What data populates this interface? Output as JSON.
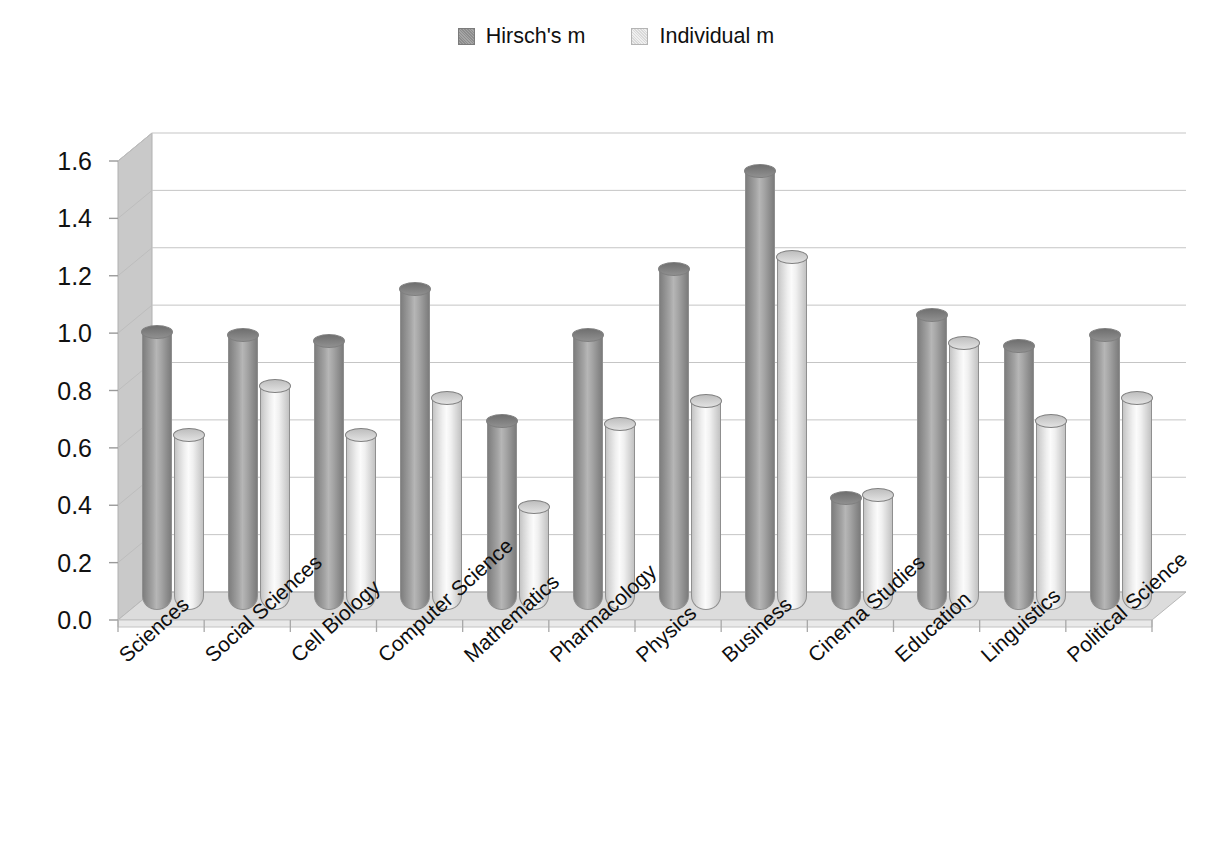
{
  "legend": {
    "position": "top-center",
    "entries": [
      {
        "label": "Hirsch's m",
        "swatch": "dark-gray-square-icon",
        "color": "#9a9a9a"
      },
      {
        "label": "Individual m",
        "swatch": "light-gray-square-icon",
        "color": "#e2e2e2"
      }
    ]
  },
  "axis": {
    "y_ticks": [
      "0.0",
      "0.2",
      "0.4",
      "0.6",
      "0.8",
      "1.0",
      "1.2",
      "1.4",
      "1.6"
    ]
  },
  "chart_data": {
    "type": "bar",
    "title": "",
    "subtitle": "",
    "xlabel": "",
    "ylabel": "",
    "ylim": [
      0.0,
      1.6
    ],
    "ytick_step": 0.2,
    "grid": true,
    "legend_position": "top-center",
    "style_3d": true,
    "bar_shape": "cylinder",
    "categories": [
      "Sciences",
      "Social Sciences",
      "Cell Biology",
      "Computer Science",
      "Mathematics",
      "Pharmacology",
      "Physics",
      "Business",
      "Cinema Studies",
      "Education",
      "Linguistics",
      "Political Science"
    ],
    "series": [
      {
        "name": "Hirsch's m",
        "color": "#9a9a9a",
        "values": [
          0.97,
          0.96,
          0.94,
          1.12,
          0.66,
          0.96,
          1.19,
          1.53,
          0.39,
          1.03,
          0.92,
          0.96
        ]
      },
      {
        "name": "Individual m",
        "color": "#e8e8e8",
        "values": [
          0.61,
          0.78,
          0.61,
          0.74,
          0.36,
          0.65,
          0.73,
          1.23,
          0.4,
          0.93,
          0.66,
          0.74
        ]
      }
    ]
  }
}
